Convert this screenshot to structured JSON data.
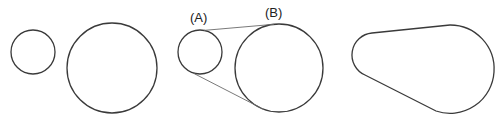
{
  "diagram": {
    "stroke_color": "#3a3a3a",
    "panels": [
      {
        "name": "separate-circles",
        "small_circle": {
          "cx": 33,
          "cy": 52,
          "r": 22
        },
        "large_circle": {
          "cx": 112,
          "cy": 68,
          "r": 45
        }
      },
      {
        "name": "tangent-construction",
        "labels": {
          "a": "(A)",
          "b": "(B)"
        },
        "small_circle": {
          "cx": 200,
          "cy": 52,
          "r": 22
        },
        "large_circle": {
          "cx": 279,
          "cy": 68,
          "r": 44
        }
      },
      {
        "name": "belt-outline"
      }
    ]
  }
}
